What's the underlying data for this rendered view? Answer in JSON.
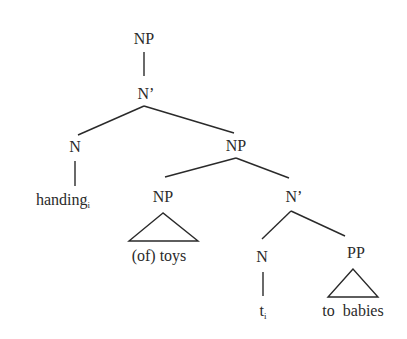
{
  "diagram": {
    "type": "syntax-tree",
    "nodes": {
      "root_np": {
        "label": "NP"
      },
      "n_bar_top": {
        "label": "N’"
      },
      "n_left": {
        "label": "N"
      },
      "handing": {
        "word": "handing",
        "index": "i"
      },
      "np_mid": {
        "label": "NP"
      },
      "np_of_toys": {
        "label": "NP"
      },
      "of_toys": {
        "text": "(of) toys"
      },
      "n_bar_low": {
        "label": "N’"
      },
      "n_trace": {
        "label": "N"
      },
      "trace": {
        "word": "t",
        "index": "i"
      },
      "pp": {
        "label": "PP"
      },
      "to_babies": {
        "text": "to  babies"
      }
    },
    "colors": {
      "ink": "#2a2a2a",
      "background": "#ffffff"
    }
  }
}
